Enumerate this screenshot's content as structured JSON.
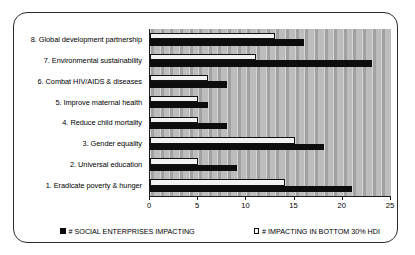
{
  "chart_data": {
    "type": "bar",
    "orientation": "horizontal",
    "title": "",
    "xlabel": "",
    "ylabel": "",
    "xlim": [
      0,
      25
    ],
    "xticks": [
      0,
      5,
      10,
      15,
      20,
      25
    ],
    "xtick_labels": [
      "0",
      "5",
      "10",
      "15",
      "20",
      "25"
    ],
    "grid": false,
    "legend_position": "bottom",
    "categories": [
      "1. Eradicate poverty & hunger",
      "2. Universal education",
      "3. Gender equality",
      "4. Reduce child mortality",
      "5. Improve maternal health",
      "6. Combat HIV/AIDS & diseases",
      "7. Environmental sustainability",
      "8. Global development partnership"
    ],
    "series": [
      {
        "name": "# SOCIAL ENTERPRISES IMPACTING",
        "color": "#0d0d0d",
        "values": [
          21,
          9,
          18,
          8,
          6,
          8,
          23,
          16
        ]
      },
      {
        "name": "# IMPACTING IN BOTTOM 30% HDI",
        "color": "#f2f2f2",
        "values": [
          14,
          5,
          15,
          5,
          5,
          6,
          11,
          13
        ]
      }
    ]
  },
  "legend": {
    "entries": [
      {
        "label": "# SOCIAL ENTERPRISES IMPACTING",
        "swatch": "filled-black-square"
      },
      {
        "label": "# IMPACTING IN BOTTOM 30% HDI",
        "swatch": "outline-white-square"
      }
    ]
  }
}
